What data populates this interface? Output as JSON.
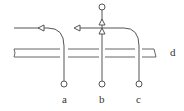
{
  "diagram": {
    "type": "flow-crossing schematic",
    "colors": {
      "line": "#555555",
      "background": "#ffffff"
    },
    "labels": {
      "a": "a",
      "b": "b",
      "c": "c",
      "d": "d"
    },
    "elements": [
      {
        "id": "a",
        "description": "line from bottom circle curving up and left, arrow pointing left"
      },
      {
        "id": "b",
        "description": "vertical line from bottom circle to top circle, two up arrows"
      },
      {
        "id": "c",
        "description": "line from bottom circle curving up and left, arrow pointing left"
      },
      {
        "id": "d",
        "description": "horizontal double-line channel crossed by a, b, c"
      }
    ]
  }
}
